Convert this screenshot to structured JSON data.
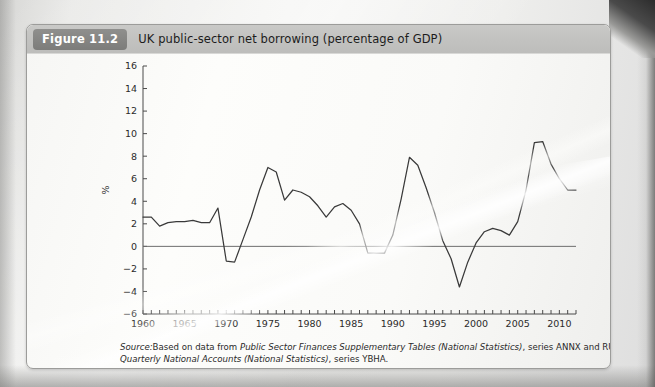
{
  "figure": {
    "badge": "Figure 11.2",
    "title": "UK public-sector net borrowing (percentage of GDP)"
  },
  "source": {
    "label": "Source:",
    "line1_a": "Based on data from ",
    "line1_italic": "Public Sector Finances Supplementary Tables (National Statistics)",
    "line1_b": ", series ANNX and RURQ;",
    "line2_italic": "Quarterly National Accounts (National Statistics)",
    "line2_b": ", series YBHA."
  },
  "chart_data": {
    "type": "line",
    "title": "UK public-sector net borrowing (percentage of GDP)",
    "xlabel": "",
    "ylabel": "%",
    "xlim": [
      1960,
      2012
    ],
    "ylim": [
      -6,
      16
    ],
    "ytick_step": 2,
    "yticks": [
      -6,
      -4,
      -2,
      0,
      2,
      4,
      6,
      8,
      10,
      12,
      14,
      16
    ],
    "xticks": [
      1960,
      1965,
      1970,
      1975,
      1980,
      1985,
      1990,
      1995,
      2000,
      2005,
      2010
    ],
    "xtick_labels": [
      "1960",
      "1965",
      "1970",
      "1975",
      "1980",
      "1985",
      "1990",
      "1995",
      "2000",
      "2005",
      "2010"
    ],
    "ytick_labels": [
      "-6",
      "-4",
      "-2",
      "0",
      "2",
      "4",
      "6",
      "8",
      "10",
      "12",
      "14",
      "16"
    ],
    "minor_xtick_step": 1,
    "grid": false,
    "legend": null,
    "zero_reference_line": 0,
    "line_color": "#3a3a3a",
    "series": [
      {
        "name": "UK public-sector net borrowing (% of GDP)",
        "x": [
          1960,
          1961,
          1962,
          1963,
          1964,
          1965,
          1966,
          1967,
          1968,
          1969,
          1970,
          1971,
          1972,
          1973,
          1974,
          1975,
          1976,
          1977,
          1978,
          1979,
          1980,
          1981,
          1982,
          1983,
          1984,
          1985,
          1986,
          1987,
          1988,
          1989,
          1990,
          1991,
          1992,
          1993,
          1994,
          1995,
          1996,
          1997,
          1998,
          1999,
          2000,
          2001,
          2002,
          2003,
          2004,
          2005,
          2006,
          2007,
          2008,
          2009,
          2010,
          2011,
          2012
        ],
        "values": [
          2.6,
          2.6,
          1.8,
          2.1,
          2.2,
          2.2,
          2.3,
          2.1,
          2.1,
          3.4,
          -1.3,
          -1.4,
          0.6,
          2.6,
          5.0,
          7.0,
          6.6,
          4.1,
          5.0,
          4.8,
          4.4,
          3.6,
          2.6,
          3.5,
          3.8,
          3.2,
          2.0,
          -0.6,
          -0.6,
          -0.6,
          1.0,
          4.2,
          7.9,
          7.2,
          5.2,
          3.0,
          0.5,
          -1.1,
          -3.6,
          -1.4,
          0.3,
          1.3,
          1.6,
          1.4,
          1.0,
          2.2,
          5.0,
          9.2,
          9.3,
          7.3,
          6.0,
          5.0,
          5.0
        ]
      }
    ]
  }
}
